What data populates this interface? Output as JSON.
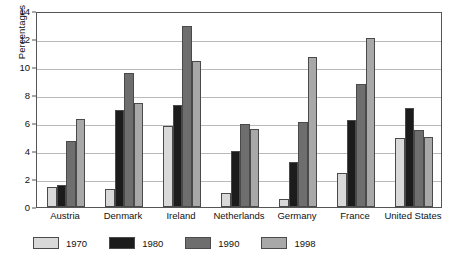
{
  "chart_data": {
    "type": "bar",
    "title": "",
    "xlabel": "",
    "ylabel": "Percentages",
    "ylim": [
      0,
      14
    ],
    "yticks": [
      0,
      2,
      4,
      6,
      8,
      10,
      12,
      14
    ],
    "grid": true,
    "legend_position": "bottom-left",
    "categories": [
      "Austria",
      "Denmark",
      "Ireland",
      "Netherlands",
      "Germany",
      "France",
      "United States"
    ],
    "series": [
      {
        "name": "1970",
        "color": "#d9d9d9",
        "values": [
          1.4,
          1.3,
          5.8,
          1.0,
          0.6,
          2.4,
          4.9
        ]
      },
      {
        "name": "1980",
        "color": "#1c1c1c",
        "values": [
          1.6,
          6.9,
          7.3,
          4.0,
          3.2,
          6.2,
          7.1
        ]
      },
      {
        "name": "1990",
        "color": "#6e6e6e",
        "values": [
          4.7,
          9.6,
          12.9,
          5.9,
          6.1,
          8.8,
          5.5
        ]
      },
      {
        "name": "1998",
        "color": "#a8a8a8",
        "values": [
          6.3,
          7.4,
          10.4,
          5.6,
          10.7,
          12.1,
          5.0
        ]
      }
    ]
  },
  "legend": {
    "items": [
      {
        "label": "1970"
      },
      {
        "label": "1980"
      },
      {
        "label": "1990"
      },
      {
        "label": "1998"
      }
    ]
  }
}
